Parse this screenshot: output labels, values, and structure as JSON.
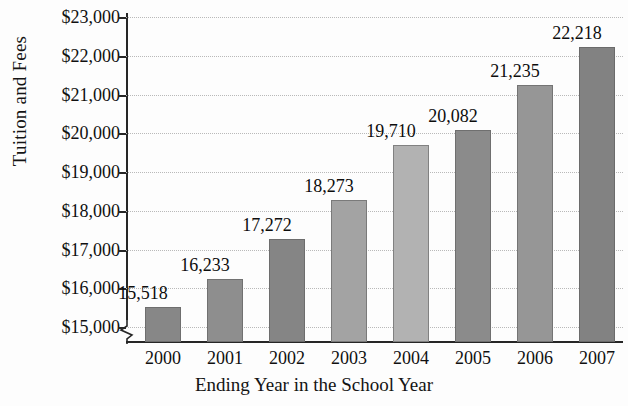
{
  "chart_data": {
    "type": "bar",
    "title": "",
    "xlabel": "Ending Year in the School Year",
    "ylabel": "Tuition and Fees",
    "categories": [
      "2000",
      "2001",
      "2002",
      "2003",
      "2004",
      "2005",
      "2006",
      "2007"
    ],
    "values": [
      15518,
      16233,
      17272,
      18273,
      19710,
      20082,
      21235,
      22218
    ],
    "value_labels": [
      "15,518",
      "16,233",
      "17,272",
      "18,273",
      "19,710",
      "20,082",
      "21,235",
      "22,218"
    ],
    "ylim": [
      14620,
      23000
    ],
    "y_axis_broken": true,
    "y_ticks": [
      15000,
      16000,
      17000,
      18000,
      19000,
      20000,
      21000,
      22000,
      23000
    ],
    "y_tick_labels": [
      "$15,000",
      "$16,000",
      "$17,000",
      "$18,000",
      "$19,000",
      "$20,000",
      "$21,000",
      "$22,000",
      "$23,000"
    ],
    "grid": true,
    "legend": "none",
    "bar_colors": [
      "#878787",
      "#8e8e8e",
      "#858585",
      "#a3a3a3",
      "#b2b2b2",
      "#8b8b8b",
      "#969696",
      "#828282"
    ],
    "plot_background": "#fdfdfd",
    "axis_color": "#262626",
    "gridline_color": "#b9b9b9"
  }
}
